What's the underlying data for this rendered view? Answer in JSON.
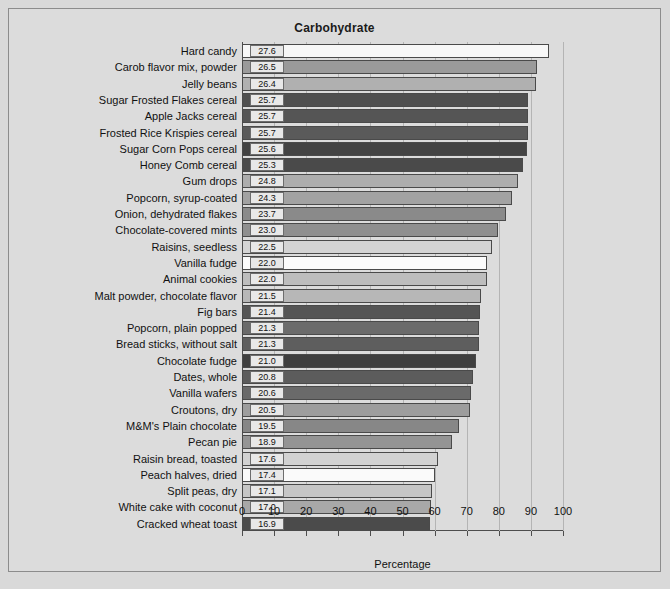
{
  "chart_data": {
    "type": "bar",
    "orientation": "horizontal",
    "title": "Carbohydrate",
    "xlabel": "Percentage",
    "ylabel": "",
    "xlim": [
      0,
      100
    ],
    "xticks": [
      0,
      10,
      20,
      30,
      40,
      50,
      60,
      70,
      80,
      90,
      100
    ],
    "grid": true,
    "grid_axis": "x",
    "legend": "none",
    "bar_scale_factor": 3.464,
    "categories": [
      "Hard candy",
      "Carob flavor mix, powder",
      "Jelly beans",
      "Sugar Frosted Flakes cereal",
      "Apple Jacks cereal",
      "Frosted Rice Krispies cereal",
      "Sugar Corn Pops cereal",
      "Honey Comb cereal",
      "Gum drops",
      "Popcorn, syrup-coated",
      "Onion, dehydrated flakes",
      "Chocolate-covered mints",
      "Raisins, seedless",
      "Vanilla fudge",
      "Animal cookies",
      "Malt powder, chocolate flavor",
      "Fig bars",
      "Popcorn, plain popped",
      "Bread sticks, without salt",
      "Chocolate fudge",
      "Dates, whole",
      "Vanilla wafers",
      "Croutons, dry",
      "M&M's Plain chocolate",
      "Pecan pie",
      "Raisin bread, toasted",
      "Peach halves, dried",
      "Split peas, dry",
      "White cake with coconut",
      "Cracked wheat toast"
    ],
    "values": [
      27.6,
      26.5,
      26.4,
      25.7,
      25.7,
      25.7,
      25.6,
      25.3,
      24.8,
      24.3,
      23.7,
      23.0,
      22.5,
      22.0,
      22.0,
      21.5,
      21.4,
      21.3,
      21.3,
      21.0,
      20.8,
      20.6,
      20.5,
      19.5,
      18.9,
      17.6,
      17.4,
      17.1,
      17.0,
      16.9
    ],
    "value_labels": [
      "27.6",
      "26.5",
      "26.4",
      "25.7",
      "25.7",
      "25.7",
      "25.6",
      "25.3",
      "24.8",
      "24.3",
      "23.7",
      "23.0",
      "22.5",
      "22.0",
      "22.0",
      "21.5",
      "21.4",
      "21.3",
      "21.3",
      "21.0",
      "20.8",
      "20.6",
      "20.5",
      "19.5",
      "18.9",
      "17.6",
      "17.4",
      "17.1",
      "17.0",
      "16.9"
    ],
    "bar_colors": [
      "#f7f7f7",
      "#9a9a9a",
      "#b0b0b0",
      "#4f4f4f",
      "#555555",
      "#5a5a5a",
      "#434343",
      "#4a4a4a",
      "#adadad",
      "#a2a2a2",
      "#8a8a8a",
      "#8f8f8f",
      "#d4d4d4",
      "#fbfbfb",
      "#bdbdbd",
      "#b7b7b7",
      "#555555",
      "#6b6b6b",
      "#5e5e5e",
      "#3f3f3f",
      "#5c5c5c",
      "#6a6a6a",
      "#9d9d9d",
      "#878787",
      "#949494",
      "#d2d2d2",
      "#fafafa",
      "#c6c6c6",
      "#a8a8a8",
      "#4b4b4b"
    ],
    "tick_labels": [
      "0",
      "10",
      "20",
      "30",
      "40",
      "50",
      "60",
      "70",
      "80",
      "90",
      "100"
    ]
  },
  "style": {
    "background": "#d9d9d9",
    "plot_background": "#dcdcdc",
    "frame_border": "#8c8c8c",
    "gridline_color": "#b4b4b4",
    "axis_color": "#4d4d4d",
    "text_color": "#111111"
  }
}
